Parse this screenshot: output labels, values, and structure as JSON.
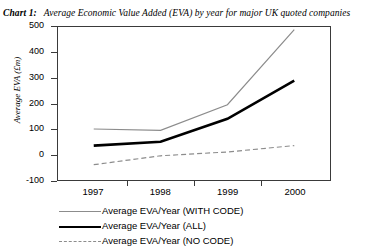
{
  "title": {
    "tag": "Chart 1:",
    "text": "Average Economic Value Added (EVA) by year for major UK quoted companies"
  },
  "axes": {
    "ylabel": "Average EVA (£m)",
    "xlabel": "",
    "yticks": [
      "500",
      "400",
      "300",
      "200",
      "100",
      "0",
      "-100"
    ],
    "xticks": [
      "1997",
      "1998",
      "1999",
      "2000"
    ]
  },
  "legend": {
    "items": [
      {
        "label": "Average EVA/Year (WITH CODE)",
        "style": "solid-thin",
        "color": "#8c8c8c"
      },
      {
        "label": "Average EVA/Year (ALL)",
        "style": "solid-thick",
        "color": "#000000"
      },
      {
        "label": "Average EVA/Year (NO CODE)",
        "style": "dashed",
        "color": "#8c8c8c"
      }
    ]
  },
  "colors": {
    "with_code": "#8c8c8c",
    "all": "#000000",
    "no_code": "#8c8c8c",
    "frame": "#3a3a3a",
    "background": "#ffffff"
  },
  "chart_data": {
    "type": "line",
    "xlabel": "",
    "ylabel": "Average EVA (£m)",
    "categories": [
      "1997",
      "1998",
      "1999",
      "2000"
    ],
    "x": [
      1997,
      1998,
      1999,
      2000
    ],
    "ylim": [
      -100,
      500
    ],
    "yticks": [
      -100,
      0,
      100,
      200,
      300,
      400,
      500
    ],
    "grid": false,
    "legend_position": "below",
    "series": [
      {
        "name": "Average EVA/Year (WITH CODE)",
        "values": [
          100,
          95,
          195,
          490
        ],
        "style": "solid-thin",
        "color": "#8c8c8c"
      },
      {
        "name": "Average EVA/Year (ALL)",
        "values": [
          35,
          50,
          140,
          290
        ],
        "style": "solid-thick",
        "color": "#000000"
      },
      {
        "name": "Average EVA/Year (NO CODE)",
        "values": [
          -40,
          -5,
          10,
          35
        ],
        "style": "dashed",
        "color": "#8c8c8c"
      }
    ]
  }
}
